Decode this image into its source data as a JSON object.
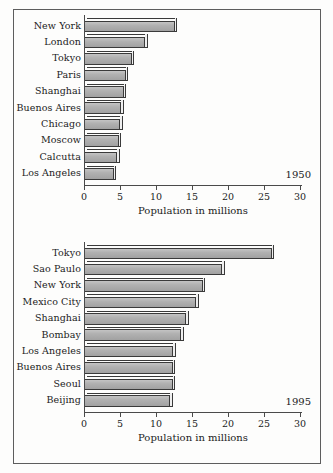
{
  "figure": {
    "background_color": "#fdfdfc",
    "frame_color": "#5d5d5d",
    "bar_fill_color": "#a8a8a8",
    "bar_outline_color": "#3a3a3a"
  },
  "chart_data": [
    {
      "type": "bar",
      "orientation": "horizontal",
      "title": "",
      "annotation": "1950",
      "xlabel": "Population in millions",
      "ylabel": "",
      "xlim": [
        0,
        30
      ],
      "xticks": [
        0,
        5,
        10,
        15,
        20,
        25,
        30
      ],
      "xtick_labels": [
        "0",
        "5",
        "10",
        "15",
        "20",
        "25",
        "30"
      ],
      "grid": false,
      "legend": null,
      "categories": [
        "New York",
        "London",
        "Tokyo",
        "Paris",
        "Shanghai",
        "Buenos Aires",
        "Chicago",
        "Moscow",
        "Calcutta",
        "Los Angeles"
      ],
      "values": [
        12.6,
        8.5,
        6.6,
        5.8,
        5.5,
        5.2,
        5.0,
        4.8,
        4.6,
        4.1
      ]
    },
    {
      "type": "bar",
      "orientation": "horizontal",
      "title": "",
      "annotation": "1995",
      "xlabel": "Population in millions",
      "ylabel": "",
      "xlim": [
        0,
        30
      ],
      "xticks": [
        0,
        5,
        10,
        15,
        20,
        25,
        30
      ],
      "xtick_labels": [
        "0",
        "5",
        "10",
        "15",
        "20",
        "25",
        "30"
      ],
      "grid": false,
      "legend": null,
      "categories": [
        "Tokyo",
        "Sao Paulo",
        "New York",
        "Mexico City",
        "Shanghai",
        "Bombay",
        "Los Angeles",
        "Buenos Aires",
        "Seoul",
        "Beijing"
      ],
      "values": [
        26.1,
        19.2,
        16.5,
        15.6,
        14.2,
        13.5,
        12.4,
        12.3,
        12.3,
        12.0
      ]
    }
  ]
}
